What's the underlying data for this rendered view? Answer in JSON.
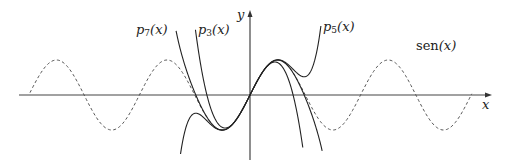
{
  "chart_data": {
    "type": "line",
    "title": "",
    "xlabel": "x",
    "ylabel": "y",
    "grid": false,
    "legend": "inline labels",
    "axes": {
      "origin_px": [
        250,
        95
      ],
      "px_per_unit_x": 17.6,
      "px_per_unit_y": 35,
      "x_axis_px": [
        19,
        492
      ],
      "y_axis_px": [
        10,
        160
      ],
      "clip_y_px": [
        26,
        152
      ]
    },
    "series": [
      {
        "name": "sen(x)",
        "label_main": "sen",
        "label_arg": "(x)",
        "function": "sin",
        "style": "dashed",
        "domain": [
          -12.5,
          12.6
        ],
        "label_pos_px": [
          416,
          48
        ]
      },
      {
        "name": "p3(x)",
        "label_main": "p",
        "label_sub": "3",
        "label_arg": "(x)",
        "function": "taylor_sin",
        "order": 3,
        "coefficients": [
          0,
          1,
          0,
          -0.1666667
        ],
        "style": "solid",
        "domain": [
          -3.1,
          3.0
        ],
        "label_pos_px": [
          198,
          32
        ]
      },
      {
        "name": "p5(x)",
        "label_main": "p",
        "label_sub": "5",
        "label_arg": "(x)",
        "function": "taylor_sin",
        "order": 5,
        "coefficients": [
          0,
          1,
          0,
          -0.1666667,
          0,
          0.0083333
        ],
        "style": "solid",
        "domain": [
          -3.95,
          4.2
        ],
        "label_pos_px": [
          323,
          29
        ]
      },
      {
        "name": "p7(x)",
        "label_main": "p",
        "label_sub": "7",
        "label_arg": "(x)",
        "function": "taylor_sin",
        "order": 7,
        "coefficients": [
          0,
          1,
          0,
          -0.1666667,
          0,
          0.0083333,
          0,
          -0.000198413
        ],
        "style": "solid",
        "domain": [
          -4.2,
          4.1
        ],
        "label_pos_px": [
          136,
          32
        ]
      }
    ],
    "labels": {
      "x_axis": "x",
      "y_axis": "y"
    }
  },
  "colors": {
    "axis": "#444444",
    "curve": "#222222",
    "sine": "#555555"
  }
}
